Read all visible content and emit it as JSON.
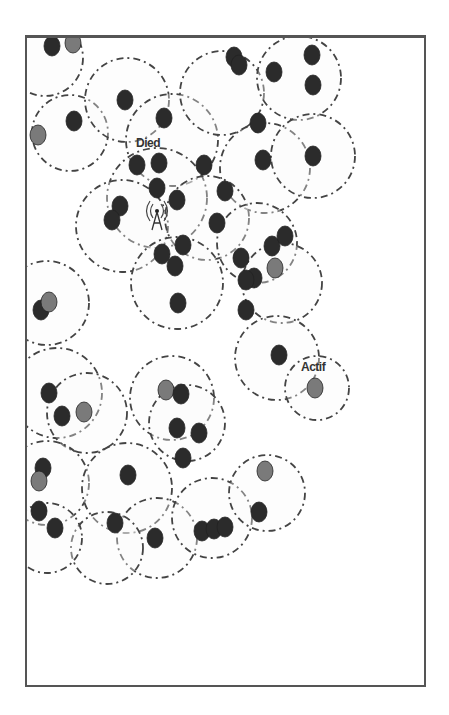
{
  "diagram": {
    "type": "wireless-sensor-network",
    "labels": {
      "dead_node": "Died",
      "active_node": "Actif"
    },
    "colors": {
      "node_dark": "#2b2b2b",
      "node_grey": "#7a7a7a",
      "range_circle": "#444444",
      "frame": "#555555"
    },
    "base_station": {
      "x": 130,
      "y": 178,
      "icon": "antenna-icon"
    },
    "ranges": [
      {
        "x": 18,
        "y": 20,
        "r": 38
      },
      {
        "x": 43,
        "y": 95,
        "r": 38
      },
      {
        "x": 100,
        "y": 62,
        "r": 42
      },
      {
        "x": 145,
        "y": 102,
        "r": 46
      },
      {
        "x": 195,
        "y": 55,
        "r": 42
      },
      {
        "x": 272,
        "y": 40,
        "r": 42
      },
      {
        "x": 238,
        "y": 130,
        "r": 45
      },
      {
        "x": 286,
        "y": 118,
        "r": 42
      },
      {
        "x": 130,
        "y": 160,
        "r": 50
      },
      {
        "x": 95,
        "y": 188,
        "r": 46
      },
      {
        "x": 180,
        "y": 180,
        "r": 42
      },
      {
        "x": 150,
        "y": 245,
        "r": 46
      },
      {
        "x": 230,
        "y": 205,
        "r": 40
      },
      {
        "x": 255,
        "y": 245,
        "r": 40
      },
      {
        "x": 250,
        "y": 320,
        "r": 42
      },
      {
        "x": 290,
        "y": 350,
        "r": 32
      },
      {
        "x": 20,
        "y": 265,
        "r": 42
      },
      {
        "x": 30,
        "y": 355,
        "r": 45
      },
      {
        "x": 60,
        "y": 375,
        "r": 40
      },
      {
        "x": 145,
        "y": 360,
        "r": 42
      },
      {
        "x": 160,
        "y": 385,
        "r": 38
      },
      {
        "x": 20,
        "y": 445,
        "r": 42
      },
      {
        "x": 100,
        "y": 450,
        "r": 45
      },
      {
        "x": 130,
        "y": 500,
        "r": 40
      },
      {
        "x": 185,
        "y": 480,
        "r": 40
      },
      {
        "x": 240,
        "y": 455,
        "r": 38
      },
      {
        "x": 80,
        "y": 510,
        "r": 36
      },
      {
        "x": 20,
        "y": 500,
        "r": 35
      }
    ],
    "nodes": [
      {
        "x": 25,
        "y": 8,
        "state": "dead"
      },
      {
        "x": 46,
        "y": 5,
        "state": "grey"
      },
      {
        "x": 11,
        "y": 97,
        "state": "grey"
      },
      {
        "x": 47,
        "y": 83,
        "state": "dead"
      },
      {
        "x": 98,
        "y": 62,
        "state": "dead"
      },
      {
        "x": 137,
        "y": 80,
        "state": "dead"
      },
      {
        "x": 110,
        "y": 127,
        "state": "dead"
      },
      {
        "x": 132,
        "y": 125,
        "state": "dead"
      },
      {
        "x": 130,
        "y": 150,
        "state": "dead"
      },
      {
        "x": 150,
        "y": 162,
        "state": "dead"
      },
      {
        "x": 93,
        "y": 168,
        "state": "dead"
      },
      {
        "x": 85,
        "y": 182,
        "state": "dead"
      },
      {
        "x": 177,
        "y": 127,
        "state": "dead"
      },
      {
        "x": 198,
        "y": 153,
        "state": "dead"
      },
      {
        "x": 190,
        "y": 185,
        "state": "dead"
      },
      {
        "x": 207,
        "y": 19,
        "state": "dead"
      },
      {
        "x": 212,
        "y": 27,
        "state": "dead"
      },
      {
        "x": 247,
        "y": 34,
        "state": "dead"
      },
      {
        "x": 285,
        "y": 17,
        "state": "dead"
      },
      {
        "x": 286,
        "y": 47,
        "state": "dead"
      },
      {
        "x": 231,
        "y": 85,
        "state": "dead"
      },
      {
        "x": 236,
        "y": 122,
        "state": "dead"
      },
      {
        "x": 286,
        "y": 118,
        "state": "dead"
      },
      {
        "x": 135,
        "y": 216,
        "state": "dead"
      },
      {
        "x": 156,
        "y": 207,
        "state": "dead"
      },
      {
        "x": 148,
        "y": 228,
        "state": "dead"
      },
      {
        "x": 151,
        "y": 265,
        "state": "dead"
      },
      {
        "x": 214,
        "y": 220,
        "state": "dead"
      },
      {
        "x": 227,
        "y": 240,
        "state": "dead"
      },
      {
        "x": 219,
        "y": 242,
        "state": "dead"
      },
      {
        "x": 245,
        "y": 208,
        "state": "dead"
      },
      {
        "x": 258,
        "y": 198,
        "state": "dead"
      },
      {
        "x": 248,
        "y": 230,
        "state": "grey"
      },
      {
        "x": 219,
        "y": 272,
        "state": "dead"
      },
      {
        "x": 252,
        "y": 317,
        "state": "dead"
      },
      {
        "x": 288,
        "y": 350,
        "state": "grey"
      },
      {
        "x": 14,
        "y": 272,
        "state": "dead"
      },
      {
        "x": 22,
        "y": 264,
        "state": "grey"
      },
      {
        "x": 22,
        "y": 355,
        "state": "dead"
      },
      {
        "x": 35,
        "y": 378,
        "state": "dead"
      },
      {
        "x": 57,
        "y": 374,
        "state": "grey"
      },
      {
        "x": 139,
        "y": 352,
        "state": "grey"
      },
      {
        "x": 154,
        "y": 356,
        "state": "dead"
      },
      {
        "x": 150,
        "y": 390,
        "state": "dead"
      },
      {
        "x": 172,
        "y": 395,
        "state": "dead"
      },
      {
        "x": 156,
        "y": 420,
        "state": "dead"
      },
      {
        "x": 16,
        "y": 430,
        "state": "dead"
      },
      {
        "x": 12,
        "y": 443,
        "state": "grey"
      },
      {
        "x": 12,
        "y": 473,
        "state": "dead"
      },
      {
        "x": 28,
        "y": 490,
        "state": "dead"
      },
      {
        "x": 101,
        "y": 437,
        "state": "dead"
      },
      {
        "x": 88,
        "y": 485,
        "state": "dead"
      },
      {
        "x": 128,
        "y": 500,
        "state": "dead"
      },
      {
        "x": 175,
        "y": 493,
        "state": "dead"
      },
      {
        "x": 187,
        "y": 491,
        "state": "dead"
      },
      {
        "x": 198,
        "y": 489,
        "state": "dead"
      },
      {
        "x": 238,
        "y": 433,
        "state": "grey"
      },
      {
        "x": 232,
        "y": 474,
        "state": "dead"
      }
    ]
  }
}
